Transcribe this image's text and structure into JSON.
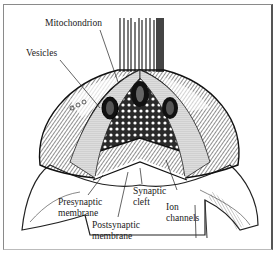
{
  "figure": {
    "labels": {
      "mitochondrion": "Mitochondrion",
      "vesicles": "Vesicles",
      "presynaptic_line1": "Presynaptic",
      "presynaptic_line2": "membrane",
      "postsynaptic_line1": "Postsynaptic",
      "postsynaptic_line2": "membrane",
      "synaptic_line1": "Synaptic",
      "synaptic_line2": "cleft",
      "ion_line1": "Ion",
      "ion_line2": "channels"
    },
    "colors": {
      "ink": "#1a1a1a",
      "paper": "#ffffff",
      "shade": "#555555"
    }
  }
}
